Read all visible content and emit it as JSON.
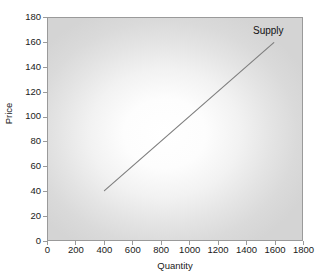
{
  "chart_data": {
    "type": "line",
    "title": "",
    "xlabel": "Quantity",
    "ylabel": "Price",
    "xlim": [
      0,
      1800
    ],
    "ylim": [
      0,
      180
    ],
    "xticks": [
      0,
      200,
      400,
      600,
      800,
      1000,
      1200,
      1400,
      1600,
      1800
    ],
    "yticks": [
      0,
      20,
      40,
      60,
      80,
      100,
      120,
      140,
      160,
      180
    ],
    "grid": false,
    "legend_position": "inline-annotation",
    "series": [
      {
        "name": "Supply",
        "x": [
          400,
          1600
        ],
        "y": [
          40,
          160
        ],
        "color": "#808080",
        "annotation": "Supply"
      }
    ],
    "annotations": [
      {
        "text": "Supply",
        "x": 1600,
        "y": 168
      }
    ],
    "style": {
      "plot_background_center": "#ffffff",
      "plot_background_edge": "#d4d4d4",
      "axis_color": "#9a9a9a",
      "text_color": "#1a1a1a",
      "line_color": "#808080"
    }
  },
  "axes": {
    "y_title": "Price",
    "x_title": "Quantity",
    "y_tick_labels": [
      "180",
      "160",
      "140",
      "120",
      "100",
      "80",
      "60",
      "40",
      "20",
      "0"
    ],
    "x_tick_labels": [
      "0",
      "200",
      "400",
      "600",
      "800",
      "1000",
      "1200",
      "1400",
      "1600",
      "1800"
    ]
  },
  "series_label": {
    "supply": "Supply"
  }
}
